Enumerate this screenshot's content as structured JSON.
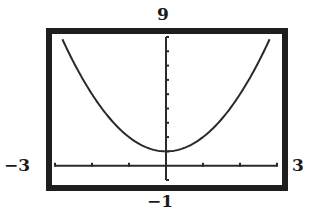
{
  "window": {
    "xmin_label": "−3",
    "xmax_label": "3",
    "ymin_label": "−1",
    "ymax_label": "9"
  },
  "colors": {
    "frame": "#1e1e1e",
    "curve": "#2a2a2a",
    "axis": "#2a2a2a",
    "background": "#ffffff"
  },
  "chart_data": {
    "type": "line",
    "title": "",
    "xlabel": "",
    "ylabel": "",
    "xlim": [
      -3,
      3
    ],
    "ylim": [
      -1,
      9
    ],
    "x_tick_step": 1,
    "y_tick_step": 1,
    "grid": false,
    "legend": null,
    "series": [
      {
        "name": "y = x^2 + 1",
        "x": [
          -2.8,
          -2.5,
          -2.0,
          -1.5,
          -1.0,
          -0.5,
          0.0,
          0.5,
          1.0,
          1.5,
          2.0,
          2.5,
          2.8
        ],
        "y": [
          8.84,
          7.25,
          5.0,
          3.25,
          2.0,
          1.25,
          1.0,
          1.25,
          2.0,
          3.25,
          5.0,
          7.25,
          8.84
        ]
      }
    ],
    "annotations": [
      {
        "text": "9",
        "position": "top-center",
        "meaning": "Ymax"
      },
      {
        "text": "−1",
        "position": "bottom-center",
        "meaning": "Ymin"
      },
      {
        "text": "−3",
        "position": "left-at-x-axis",
        "meaning": "Xmin"
      },
      {
        "text": "3",
        "position": "right-at-x-axis",
        "meaning": "Xmax"
      }
    ]
  }
}
